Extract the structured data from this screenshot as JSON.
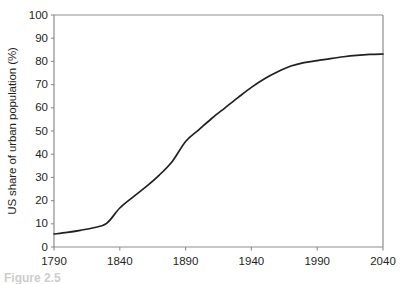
{
  "figure": {
    "caption_fragment": "Figure 2.5",
    "background_color": "#ffffff",
    "line_color": "#231f20",
    "axis_color": "#8d8d8d",
    "text_color": "#231f20"
  },
  "chart_data": {
    "type": "line",
    "title": "",
    "subtitle": "",
    "xlabel": "",
    "ylabel": "US share of urban population (%)",
    "xlim": [
      1790,
      2040
    ],
    "ylim": [
      0,
      100
    ],
    "grid": false,
    "legend": null,
    "xticks": [
      1790,
      1840,
      1890,
      1940,
      1990,
      2040
    ],
    "yticks": [
      0,
      10,
      20,
      30,
      40,
      50,
      60,
      70,
      80,
      90,
      100
    ],
    "xtick_labels": [
      "1790",
      "1840",
      "1890",
      "1940",
      "1990",
      "2040"
    ],
    "ytick_labels": [
      "0",
      "10",
      "20",
      "30",
      "40",
      "50",
      "60",
      "70",
      "80",
      "90",
      "100"
    ],
    "series": [
      {
        "name": "US share of urban population",
        "x": [
          1790,
          1800,
          1810,
          1820,
          1830,
          1840,
          1850,
          1860,
          1870,
          1880,
          1890,
          1900,
          1910,
          1920,
          1930,
          1940,
          1950,
          1960,
          1970,
          1980,
          1990,
          2000,
          2010,
          2020,
          2030,
          2040
        ],
        "y": [
          5.6,
          6.3,
          7.2,
          8.3,
          10.2,
          16.8,
          21.5,
          26.0,
          31.0,
          37.0,
          45.5,
          50.5,
          55.5,
          60.0,
          64.5,
          68.8,
          72.5,
          75.5,
          78.0,
          79.5,
          80.3,
          81.2,
          82.0,
          82.6,
          83.0,
          83.2
        ]
      }
    ],
    "annotations": []
  }
}
